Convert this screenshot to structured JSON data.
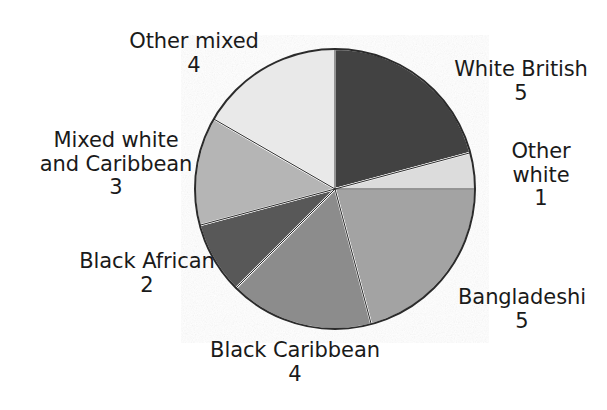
{
  "chart_data": {
    "type": "pie",
    "title": "",
    "total": 24,
    "start_angle_deg": 0,
    "direction": "clockwise",
    "center": {
      "x": 335,
      "y": 189
    },
    "radius": 140,
    "legend": "labels-outside-slices",
    "grid": false,
    "categories": [
      "White British",
      "Other white",
      "Bangladeshi",
      "Black Caribbean",
      "Black African",
      "Mixed white and Caribbean",
      "Other mixed"
    ],
    "values": [
      5,
      1,
      5,
      4,
      2,
      3,
      4
    ],
    "slices": [
      {
        "id": "white-british",
        "label_lines": [
          "White British"
        ],
        "value": 5,
        "value_text": "5",
        "color": "#424242",
        "start_deg": 0,
        "end_deg": 75
      },
      {
        "id": "other-white",
        "label_lines": [
          "Other",
          "white"
        ],
        "value": 1,
        "value_text": "1",
        "color": "#dcdcdc",
        "start_deg": 75,
        "end_deg": 90
      },
      {
        "id": "bangladeshi",
        "label_lines": [
          "Bangladeshi"
        ],
        "value": 5,
        "value_text": "5",
        "color": "#a3a3a3",
        "start_deg": 90,
        "end_deg": 165
      },
      {
        "id": "black-caribbean",
        "label_lines": [
          "Black Caribbean"
        ],
        "value": 4,
        "value_text": "4",
        "color": "#8c8c8c",
        "start_deg": 165,
        "end_deg": 225
      },
      {
        "id": "black-african",
        "label_lines": [
          "Black African"
        ],
        "value": 2,
        "value_text": "2",
        "color": "#585858",
        "start_deg": 225,
        "end_deg": 255
      },
      {
        "id": "mixed-white-caribbean",
        "label_lines": [
          "Mixed white",
          "and Caribbean"
        ],
        "value": 3,
        "value_text": "3",
        "color": "#b5b5b5",
        "start_deg": 255,
        "end_deg": 300
      },
      {
        "id": "other-mixed",
        "label_lines": [
          "Other mixed"
        ],
        "value": 4,
        "value_text": "4",
        "color": "#e9e9e9",
        "start_deg": 300,
        "end_deg": 360
      }
    ]
  },
  "labels": {
    "white_british": {
      "name": "White British",
      "value": "5"
    },
    "other_white": {
      "name_line1": "Other",
      "name_line2": "white",
      "value": "1"
    },
    "bangladeshi": {
      "name": "Bangladeshi",
      "value": "5"
    },
    "black_caribbean": {
      "name": "Black Caribbean",
      "value": "4"
    },
    "black_african": {
      "name": "Black African",
      "value": "2"
    },
    "mixed_white_caribbean": {
      "name_line1": "Mixed white",
      "name_line2": "and Caribbean",
      "value": "3"
    },
    "other_mixed": {
      "name": "Other mixed",
      "value": "4"
    }
  },
  "colors": {
    "outline": "#2b2b2b",
    "separator": "#ffffff",
    "text": "#1a1a1a",
    "background": "#ffffff"
  }
}
